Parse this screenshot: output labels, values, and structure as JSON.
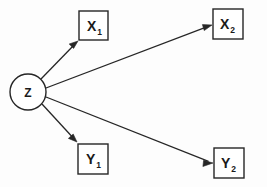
{
  "diagram": {
    "type": "path-diagram",
    "background_color": "#fdfdfd",
    "stroke_color": "#262626",
    "fill_color": "#ffffff",
    "latent": {
      "id": "Z",
      "label": "Z",
      "shape": "circle",
      "cx": 28,
      "cy": 92,
      "r": 18
    },
    "indicators": [
      {
        "id": "X1",
        "base": "X",
        "subscript": "1",
        "shape": "box",
        "x": 79,
        "y": 11,
        "width": 29,
        "height": 29
      },
      {
        "id": "X2",
        "base": "X",
        "subscript": "2",
        "shape": "box",
        "x": 213,
        "y": 9,
        "width": 30,
        "height": 30
      },
      {
        "id": "Y1",
        "base": "Y",
        "subscript": "1",
        "shape": "box",
        "x": 78,
        "y": 144,
        "width": 30,
        "height": 30
      },
      {
        "id": "Y2",
        "base": "Y",
        "subscript": "2",
        "shape": "box",
        "x": 214,
        "y": 148,
        "width": 30,
        "height": 30
      }
    ],
    "edges": [
      {
        "id": "Z-to-X1",
        "from": "Z",
        "to": "X1",
        "x1": 41,
        "y1": 79,
        "x2": 78,
        "y2": 41,
        "arrowhead": "to"
      },
      {
        "id": "Z-to-X2",
        "from": "Z",
        "to": "X2",
        "x1": 46,
        "y1": 88,
        "x2": 212,
        "y2": 25,
        "arrowhead": "to"
      },
      {
        "id": "Z-to-Y1",
        "from": "Z",
        "to": "Y1",
        "x1": 42,
        "y1": 104,
        "x2": 77,
        "y2": 142,
        "arrowhead": "to"
      },
      {
        "id": "Z-to-Y2",
        "from": "Z",
        "to": "Y2",
        "x1": 46,
        "y1": 97,
        "x2": 213,
        "y2": 163,
        "arrowhead": "to"
      }
    ]
  }
}
